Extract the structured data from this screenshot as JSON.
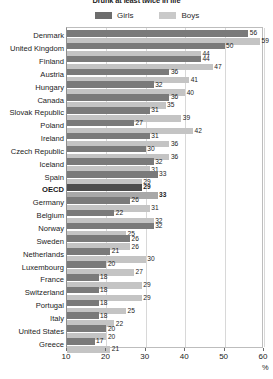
{
  "chart_data": {
    "type": "bar",
    "orientation": "horizontal",
    "title": "Drunk at least twice in life",
    "xlabel": "%",
    "ylabel": "",
    "xlim": [
      10,
      60
    ],
    "xticks": [
      10,
      20,
      30,
      40,
      50,
      60
    ],
    "grid": true,
    "legend_position": "top-center",
    "categories": [
      "Denmark",
      "United Kingdom",
      "Finland",
      "Austria",
      "Hungary",
      "Canada",
      "Slovak Republic",
      "Poland",
      "Ireland",
      "Czech Republic",
      "Iceland",
      "Spain",
      "OECD",
      "Germany",
      "Belgium",
      "Norway",
      "Sweden",
      "Netherlands",
      "Luxembourg",
      "France",
      "Switzerland",
      "Portugal",
      "Italy",
      "United States",
      "Greece"
    ],
    "highlight_category": "OECD",
    "series": [
      {
        "name": "Girls",
        "color": "#7a7a7a",
        "values": [
          56,
          50,
          44,
          36,
          32,
          36,
          31,
          27,
          31,
          30,
          32,
          33,
          29,
          26,
          22,
          32,
          26,
          21,
          20,
          18,
          18,
          18,
          18,
          20,
          17
        ]
      },
      {
        "name": "Boys",
        "color": "#c4c4c4",
        "values": [
          59,
          44,
          47,
          41,
          40,
          35,
          39,
          42,
          36,
          36,
          31,
          29,
          33,
          31,
          32,
          25,
          26,
          30,
          27,
          29,
          29,
          25,
          22,
          20,
          21
        ]
      }
    ]
  }
}
